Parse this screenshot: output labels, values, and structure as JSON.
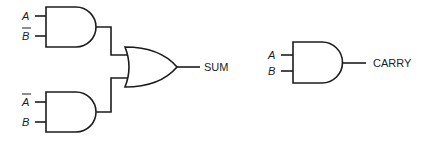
{
  "diagram": {
    "colors": {
      "stroke": "#1c1c1c",
      "background": "#ffffff"
    },
    "sum_circuit": {
      "and_gate_1": {
        "inputs": [
          "A",
          "B"
        ],
        "inverted": [
          false,
          true
        ]
      },
      "and_gate_2": {
        "inputs": [
          "A",
          "B"
        ],
        "inverted": [
          true,
          false
        ]
      },
      "or_gate": {
        "output_label": "SUM"
      }
    },
    "carry_circuit": {
      "and_gate": {
        "inputs": [
          "A",
          "B"
        ],
        "inverted": [
          false,
          false
        ],
        "output_label": "CARRY"
      }
    }
  }
}
